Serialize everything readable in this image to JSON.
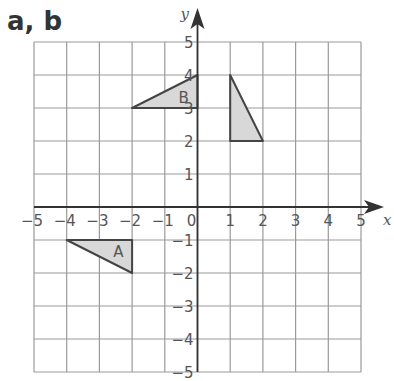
{
  "title": "a, b",
  "chart_data": {
    "type": "coordinate-grid",
    "xlabel": "x",
    "ylabel": "y",
    "xlim": [
      -5,
      5
    ],
    "ylim": [
      -5,
      5
    ],
    "grid": true,
    "x_ticks": [
      "-5",
      "-4",
      "-3",
      "-2",
      "-1",
      "0",
      "1",
      "2",
      "3",
      "4",
      "5"
    ],
    "y_ticks": [
      "5",
      "4",
      "3",
      "2",
      "1",
      "-1",
      "-2",
      "-3",
      "-4",
      "-5"
    ],
    "shapes": [
      {
        "label": "A",
        "vertices": [
          [
            -4,
            -1
          ],
          [
            -2,
            -1
          ],
          [
            -2,
            -2
          ]
        ],
        "fill": "#d8d8d8"
      },
      {
        "label": "B",
        "vertices": [
          [
            -2,
            3
          ],
          [
            0,
            3
          ],
          [
            0,
            4
          ]
        ],
        "fill": "#d8d8d8"
      },
      {
        "label": "",
        "vertices": [
          [
            1,
            4
          ],
          [
            1,
            2
          ],
          [
            2,
            2
          ]
        ],
        "fill": "#d8d8d8"
      }
    ]
  },
  "colors": {
    "grid": "#9a9a9a",
    "axis": "#333333",
    "shape_stroke": "#444444",
    "shape_fill": "#d8d8d8",
    "text": "#555555"
  }
}
